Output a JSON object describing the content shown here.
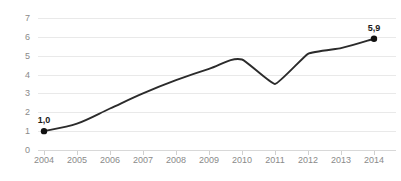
{
  "chart_data": {
    "type": "line",
    "title": "",
    "subtitle": "",
    "xlabel": "",
    "ylabel": "",
    "categories": [
      "2004",
      "2005",
      "2006",
      "2007",
      "2008",
      "2009",
      "2010",
      "2011",
      "2012",
      "2013",
      "2014"
    ],
    "x": [
      2004,
      2005,
      2006,
      2007,
      2008,
      2009,
      2010,
      2011,
      2012,
      2013,
      2014
    ],
    "series": [
      {
        "name": "",
        "values": [
          1.0,
          1.4,
          2.2,
          3.0,
          3.7,
          4.3,
          4.8,
          3.5,
          5.1,
          5.4,
          5.9
        ]
      }
    ],
    "ylim": [
      0,
      7
    ],
    "yticks": [
      0,
      1,
      2,
      3,
      4,
      5,
      6,
      7
    ],
    "ytick_labels": [
      "0",
      "1",
      "2",
      "3",
      "4",
      "5",
      "6",
      "7"
    ],
    "xtick_labels": [
      "2004",
      "2005",
      "2006",
      "2007",
      "2008",
      "2009",
      "2010",
      "2011",
      "2012",
      "2013",
      "2014"
    ],
    "grid": true,
    "grid_axis": "y",
    "legend": false,
    "legend_position": "none",
    "decimal_separator": ",",
    "annotations": [
      {
        "label": "1,0",
        "x": 2004,
        "y": 1.0,
        "marker": true
      },
      {
        "label": "5,9",
        "x": 2014,
        "y": 5.9,
        "marker": true
      }
    ],
    "colors": {
      "line": "#2b2b2b",
      "marker": "#111111",
      "grid": "#e9e9e9",
      "axis": "#d8d8d8",
      "tick_text": "#8a8a8a",
      "label_text": "#1a1a1a",
      "background": "#ffffff"
    }
  }
}
